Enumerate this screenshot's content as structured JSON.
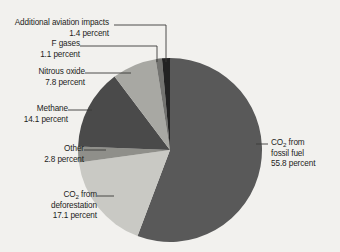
{
  "chart_data": {
    "type": "pie",
    "title": "",
    "subtitle": "",
    "xlabel": "",
    "ylabel": "",
    "legend_position": "none",
    "grid": false,
    "units": "percent",
    "center": {
      "cx": 170,
      "cy": 150,
      "r": 92
    },
    "start_angle_deg": 0,
    "direction": "clockwise",
    "categories": [
      "CO2 from fossil fuel",
      "CO2 from deforestation",
      "Other",
      "Methane",
      "Nitrous oxide",
      "F gases",
      "Additional aviation impacts"
    ],
    "values": [
      55.8,
      17.1,
      2.8,
      14.1,
      7.8,
      1.1,
      1.4
    ],
    "colors": [
      "#595959",
      "#c9c9c4",
      "#8f8f8a",
      "#4a4a4a",
      "#a8a8a3",
      "#737370",
      "#222222"
    ],
    "slices": [
      {
        "label": "CO2 from fossil fuel",
        "value": 55.8,
        "color": "#595959"
      },
      {
        "label": "CO2 from deforestation",
        "value": 17.1,
        "color": "#c9c9c4"
      },
      {
        "label": "Other",
        "value": 2.8,
        "color": "#8f8f8a"
      },
      {
        "label": "Methane",
        "value": 14.1,
        "color": "#4a4a4a"
      },
      {
        "label": "Nitrous oxide",
        "value": 7.8,
        "color": "#a8a8a3"
      },
      {
        "label": "F gases",
        "value": 1.1,
        "color": "#737370"
      },
      {
        "label": "Additional aviation impacts",
        "value": 1.4,
        "color": "#222222"
      }
    ]
  },
  "colors": {
    "background": "#f2f1ee",
    "text": "#1d1d1b",
    "leader_line": "#3a3a38",
    "slice_fossil_fuel": "#595959",
    "slice_deforestation": "#c9c9c4",
    "slice_other": "#8f8f8a",
    "slice_methane": "#4a4a4a",
    "slice_nitrous_oxide": "#a8a8a3",
    "slice_f_gases": "#737370",
    "slice_aviation": "#222222"
  },
  "labels": {
    "aviation": {
      "name": "Additional aviation impacts",
      "value": "1.4 percent"
    },
    "f_gases": {
      "name": "F gases",
      "value": "1.1 percent"
    },
    "nitrous_oxide": {
      "name": "Nitrous oxide",
      "value": "7.8 percent"
    },
    "methane": {
      "name": "Methane",
      "value": "14.1 percent"
    },
    "other": {
      "name": "Other",
      "value": "2.8 percent"
    },
    "deforestation": {
      "name_prefix": "CO",
      "name_sub": "2",
      "name_suffix": " from",
      "name_line2": "deforestation",
      "value": "17.1 percent"
    },
    "fossil_fuel": {
      "name_prefix": "CO",
      "name_sub": "2",
      "name_suffix": " from",
      "name_line2": "fossil fuel",
      "value": "55.8 percent"
    }
  }
}
